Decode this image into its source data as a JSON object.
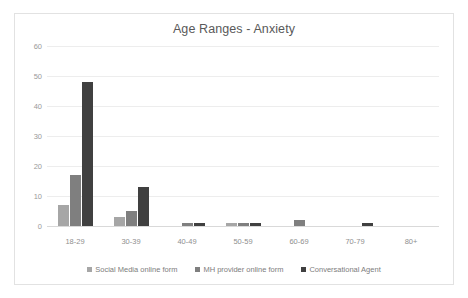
{
  "chart_data": {
    "type": "bar",
    "title": "Age Ranges - Anxiety",
    "xlabel": "",
    "ylabel": "",
    "ylim": [
      0,
      60
    ],
    "yticks": [
      0,
      10,
      20,
      30,
      40,
      50,
      60
    ],
    "grid": true,
    "legend_position": "bottom",
    "categories": [
      "18-29",
      "30-39",
      "40-49",
      "50-59",
      "60-69",
      "70-79",
      "80+"
    ],
    "series": [
      {
        "name": "Social Media online form",
        "color": "#a6a6a6",
        "values": [
          7,
          3,
          0,
          1,
          0,
          0,
          0
        ]
      },
      {
        "name": "MH provider online form",
        "color": "#7f7f7f",
        "values": [
          17,
          5,
          1,
          1,
          2,
          0,
          0
        ]
      },
      {
        "name": "Conversational Agent",
        "color": "#404040",
        "values": [
          48,
          13,
          1,
          1,
          0,
          1,
          0
        ]
      }
    ]
  }
}
